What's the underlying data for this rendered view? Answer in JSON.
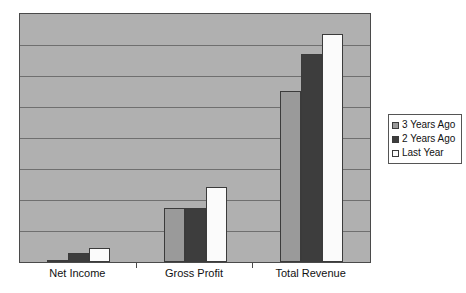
{
  "chart_data": {
    "type": "bar",
    "title": "",
    "subtitle": "",
    "xlabel": "",
    "ylabel": "",
    "categories": [
      "Net Income",
      "Gross Profit",
      "Total Revenue"
    ],
    "series": [
      {
        "name": "3 Years Ago",
        "color": "#9a9a9a",
        "values": [
          2,
          54,
          172
        ]
      },
      {
        "name": "2 Years Ago",
        "color": "#3d3d3d",
        "values": [
          9,
          54,
          210
        ]
      },
      {
        "name": "Last Year",
        "color": "#fbfbfb",
        "values": [
          14,
          76,
          230
        ]
      }
    ],
    "ylim": [
      0,
      250
    ],
    "grid": true,
    "gridlines": [
      31.25,
      62.5,
      93.75,
      125,
      156.25,
      187.5,
      218.75
    ],
    "axis_tick_labels": [],
    "legend_position": "right",
    "plot_background": "#b0b0b0",
    "page_background": "#ffffff",
    "axis_color": "#4a4a4a",
    "gridline_color": "#6f6f6f",
    "bar_border_color": "#3b3b3b"
  },
  "legend": {
    "entries": [
      {
        "label": "3 Years Ago"
      },
      {
        "label": "2 Years Ago"
      },
      {
        "label": "Last Year"
      }
    ]
  }
}
